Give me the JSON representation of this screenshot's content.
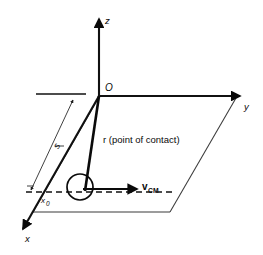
{
  "figure": {
    "kind": "3d-coordinate-diagram",
    "background_color": "#ffffff",
    "ink_color": "#0a0a0a",
    "plane_edge_color": "#3a3a3a"
  },
  "axes": {
    "z_label": "z",
    "y_label": "y",
    "x_label": "x",
    "origin_label": "O"
  },
  "labels": {
    "arc_length": "s",
    "x_offset": "x",
    "x_offset_sub": "0",
    "r_vector": "r (point of contact)",
    "v_vector": "v",
    "v_vector_sub": "CM"
  },
  "elements": {
    "ball_name": "rolling-ball",
    "plane_name": "xy-plane-parallelogram",
    "dashed_name": "ball-path-dashed-line",
    "dimension_name": "s-dimension-line"
  }
}
